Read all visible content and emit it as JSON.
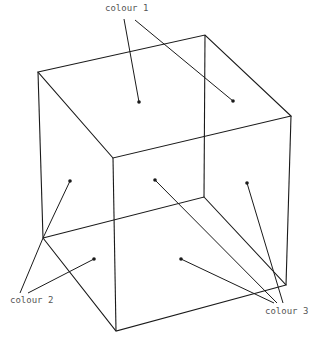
{
  "diagram": {
    "title": "",
    "labels": {
      "colour1": "colour 1",
      "colour2": "colour 2",
      "colour3": "colour 3"
    },
    "line_color": "#1a1a1a",
    "label_color": "#555555"
  }
}
